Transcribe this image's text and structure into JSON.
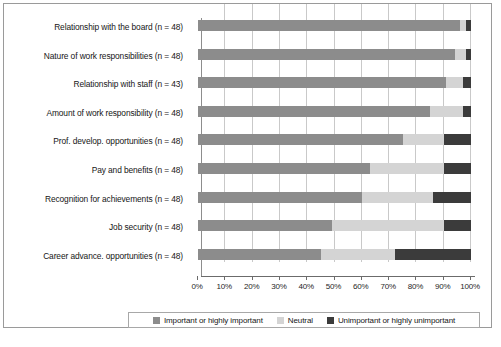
{
  "chart_data": {
    "type": "bar",
    "orientation": "horizontal",
    "stacked": true,
    "normalized_percent": true,
    "title": "",
    "xlabel": "",
    "ylabel": "",
    "xlim": [
      0,
      100
    ],
    "grid": true,
    "legend_position": "bottom",
    "xtick_labels": [
      "0%",
      "10%",
      "20%",
      "30%",
      "40%",
      "50%",
      "60%",
      "70%",
      "80%",
      "90%",
      "100%"
    ],
    "xtick_values": [
      0,
      10,
      20,
      30,
      40,
      50,
      60,
      70,
      80,
      90,
      100
    ],
    "categories": [
      "Relationship with the board (n = 48)",
      "Nature of work responsibilities (n = 48)",
      "Relationship with staff (n = 43)",
      "Amount of work responsibility (n = 48)",
      "Prof. develop. opportunities (n = 48)",
      "Pay and benefits (n = 48)",
      "Recognition for achievements (n = 48)",
      "Job security (n = 48)",
      "Career advance. opportunities (n = 48)"
    ],
    "series": [
      {
        "name": "Important or highly important",
        "color": "#8c8c8c",
        "values": [
          96,
          94,
          91,
          85,
          75,
          63,
          60,
          49,
          45
        ]
      },
      {
        "name": "Neutral",
        "color": "#d4d4d4",
        "values": [
          2,
          4,
          6,
          12,
          15,
          27,
          26,
          41,
          27
        ]
      },
      {
        "name": "Unimportant or highly unimportant",
        "color": "#3b3b3b",
        "values": [
          2,
          2,
          3,
          3,
          10,
          10,
          14,
          10,
          28
        ]
      }
    ]
  },
  "legend": {
    "entries": [
      {
        "label": "Important or highly important",
        "color": "#8c8c8c"
      },
      {
        "label": "Neutral",
        "color": "#d4d4d4"
      },
      {
        "label": "Unimportant or highly unimportant",
        "color": "#3b3b3b"
      }
    ]
  },
  "caption": {
    "text": ""
  }
}
